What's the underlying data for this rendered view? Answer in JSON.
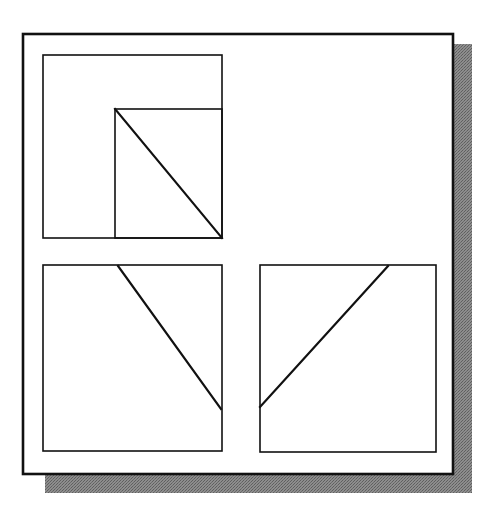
{
  "figure": {
    "canvas": {
      "width": 490,
      "height": 516,
      "background": "#ffffff"
    },
    "colors": {
      "stroke": "#111111",
      "fill": "#ffffff",
      "shadow": "#808080",
      "shadow_light": "#9a9a9a"
    },
    "shadow": {
      "name": "drop-shadow",
      "x": 45,
      "y": 44,
      "width": 427,
      "height": 449,
      "offset_x": 19,
      "offset_y": 19,
      "color": "#808080"
    },
    "outer_frame": {
      "name": "outer-frame",
      "x": 23,
      "y": 34,
      "width": 430,
      "height": 440,
      "stroke_width": 2.6
    },
    "panels": [
      {
        "id": "top-left",
        "name": "panel-top-left",
        "x": 43,
        "y": 55,
        "width": 179,
        "height": 183,
        "stroke_width": 1.6,
        "inner_rect": {
          "name": "inner-rect",
          "x": 115,
          "y": 109,
          "width": 107,
          "height": 129,
          "stroke_width": 1.6
        },
        "diagonal": {
          "name": "diagonal-line",
          "x1": 115,
          "y1": 109,
          "x2": 222,
          "y2": 238,
          "stroke_width": 2.2,
          "direction": "top-left-to-bottom-right"
        }
      },
      {
        "id": "bottom-left",
        "name": "panel-bottom-left",
        "x": 43,
        "y": 265,
        "width": 179,
        "height": 186,
        "stroke_width": 1.6,
        "inner_rect": null,
        "diagonal": {
          "name": "diagonal-line",
          "x1": 118,
          "y1": 266,
          "x2": 221,
          "y2": 409,
          "stroke_width": 2.2,
          "direction": "top-to-bottom-right"
        }
      },
      {
        "id": "bottom-right",
        "name": "panel-bottom-right",
        "x": 260,
        "y": 265,
        "width": 176,
        "height": 187,
        "stroke_width": 1.6,
        "inner_rect": null,
        "diagonal": {
          "name": "diagonal-line",
          "x1": 260,
          "y1": 407,
          "x2": 388,
          "y2": 266,
          "stroke_width": 2.2,
          "direction": "bottom-left-to-top-right"
        }
      }
    ]
  }
}
